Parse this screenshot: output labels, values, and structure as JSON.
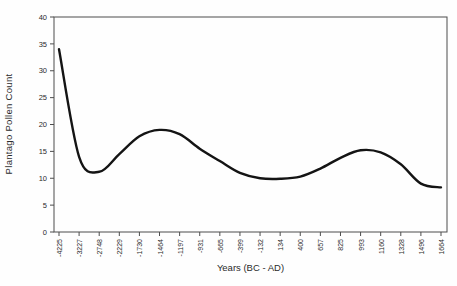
{
  "figure": {
    "background": "#fefefe",
    "axis_color": "#4d4d4d",
    "line_color": "#141414",
    "text_color": "#2b2b2b"
  },
  "chart_data": {
    "type": "line",
    "title": "",
    "xlabel": "Years (BC - AD)",
    "ylabel": "Plantago Pollen Count",
    "ylim": [
      0,
      40
    ],
    "yticks": [
      0,
      5,
      10,
      15,
      20,
      25,
      30,
      35,
      40
    ],
    "categories": [
      "-4225",
      "-3227",
      "-2748",
      "-2229",
      "-1730",
      "-1464",
      "-1197",
      "-931",
      "-665",
      "-399",
      "-132",
      "134",
      "400",
      "657",
      "825",
      "993",
      "1160",
      "1328",
      "1496",
      "1664"
    ],
    "values": [
      34,
      14,
      11.2,
      14.5,
      17.8,
      19,
      18.2,
      15.5,
      13.2,
      11,
      10,
      9.9,
      10.3,
      11.8,
      13.8,
      15.2,
      14.8,
      12.6,
      9,
      8.3
    ],
    "grid": false,
    "legend": null,
    "smooth": true,
    "line_width": 2.4
  }
}
